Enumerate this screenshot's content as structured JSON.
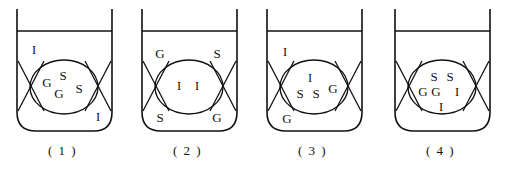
{
  "figure": {
    "type": "diagram",
    "panel_count": 4,
    "legend_symbols": [
      "G",
      "S",
      "I"
    ],
    "stroke_color": "#111111",
    "background_color": "#ffffff"
  },
  "panels": [
    {
      "caption": "( 1 )",
      "inside_labels": [
        {
          "text": "G",
          "x": 47,
          "y": 84
        },
        {
          "text": "S",
          "x": 63,
          "y": 77
        },
        {
          "text": "G",
          "x": 59,
          "y": 95
        },
        {
          "text": "S",
          "x": 79,
          "y": 90
        }
      ],
      "outside_labels": [
        {
          "text": "I",
          "x": 34,
          "y": 51
        },
        {
          "text": "I",
          "x": 98,
          "y": 118
        }
      ]
    },
    {
      "caption": "( 2 )",
      "inside_labels": [
        {
          "text": "I",
          "x": 54,
          "y": 87
        },
        {
          "text": "I",
          "x": 72,
          "y": 87
        }
      ],
      "outside_labels": [
        {
          "text": "G",
          "x": 35,
          "y": 55
        },
        {
          "text": "S",
          "x": 92,
          "y": 55
        },
        {
          "text": "S",
          "x": 35,
          "y": 119
        },
        {
          "text": "G",
          "x": 92,
          "y": 119
        }
      ]
    },
    {
      "caption": "( 3 )",
      "inside_labels": [
        {
          "text": "I",
          "x": 60,
          "y": 79
        },
        {
          "text": "S",
          "x": 50,
          "y": 95
        },
        {
          "text": "S",
          "x": 66,
          "y": 95
        },
        {
          "text": "G",
          "x": 83,
          "y": 90
        }
      ],
      "outside_labels": [
        {
          "text": "I",
          "x": 35,
          "y": 53
        },
        {
          "text": "G",
          "x": 37,
          "y": 120
        }
      ]
    },
    {
      "caption": "( 4 )",
      "inside_labels": [
        {
          "text": "S",
          "x": 56,
          "y": 78
        },
        {
          "text": "S",
          "x": 72,
          "y": 78
        },
        {
          "text": "G",
          "x": 45,
          "y": 93
        },
        {
          "text": "G",
          "x": 58,
          "y": 93
        },
        {
          "text": "I",
          "x": 79,
          "y": 93
        },
        {
          "text": "I",
          "x": 63,
          "y": 108
        }
      ],
      "outside_labels": []
    }
  ]
}
